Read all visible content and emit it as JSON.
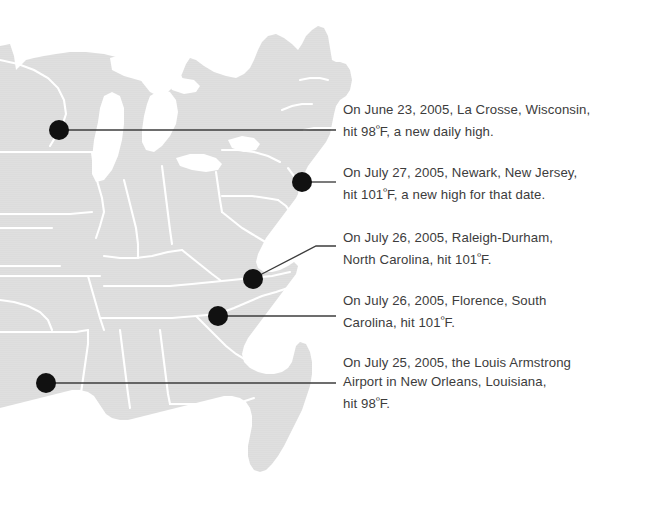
{
  "figure": {
    "type": "annotated-map",
    "region": "Eastern and Central United States",
    "background_color": "#ffffff",
    "map_fill_color": "#dcdcdc",
    "map_border_color": "#ffffff",
    "marker_color": "#111111",
    "leader_line_color": "#3c3c3c",
    "text_color": "#3c3c3c"
  },
  "annotations": [
    {
      "id": "la-crosse-wisconsin",
      "city": "La Crosse",
      "state": "Wisconsin",
      "date": "June 23, 2005",
      "temperature_f": 98,
      "lines": [
        "On June 23, 2005, La Crosse, Wisconsin,",
        "hit 98",
        "F, a new daily high."
      ],
      "text": "On June 23, 2005, La Crosse, Wisconsin, hit 98°F, a new daily high.",
      "marker": {
        "x": 59,
        "y": 130,
        "r": 10
      },
      "leader": {
        "x1": 69,
        "y1": 130,
        "x2": 336,
        "y2": 130
      }
    },
    {
      "id": "newark-new-jersey",
      "city": "Newark",
      "state": "New Jersey",
      "date": "July 27, 2005",
      "temperature_f": 101,
      "lines": [
        "On July 27, 2005, Newark, New Jersey,",
        "hit 101",
        "F, a new high for that date."
      ],
      "text": "On July 27, 2005, Newark, New Jersey, hit 101°F, a new high for that date.",
      "marker": {
        "x": 302,
        "y": 182,
        "r": 10
      },
      "leader": {
        "x1": 312,
        "y1": 182,
        "x2": 336,
        "y2": 182
      }
    },
    {
      "id": "raleigh-durham-north-carolina",
      "city": "Raleigh-Durham",
      "state": "North Carolina",
      "date": "July 26, 2005",
      "temperature_f": 101,
      "lines": [
        "On July 26, 2005, Raleigh-Durham,",
        "North Carolina, hit 101",
        "F."
      ],
      "text": "On July 26, 2005, Raleigh-Durham, North Carolina, hit 101°F.",
      "marker": {
        "x": 253,
        "y": 279,
        "r": 10
      },
      "leader": {
        "x1": 262,
        "y1": 275,
        "x2": 336,
        "y2": 246,
        "bend_x": 318,
        "bend_y": 246
      }
    },
    {
      "id": "florence-south-carolina",
      "city": "Florence",
      "state": "South Carolina",
      "date": "July 26, 2005",
      "temperature_f": 101,
      "lines": [
        "On July 26, 2005, Florence, South",
        "Carolina, hit 101",
        "F."
      ],
      "text": "On July 26, 2005, Florence, South Carolina, hit 101°F.",
      "marker": {
        "x": 218,
        "y": 316,
        "r": 10
      },
      "leader": {
        "x1": 228,
        "y1": 316,
        "x2": 336,
        "y2": 316
      }
    },
    {
      "id": "new-orleans-louisiana",
      "city": "New Orleans",
      "state": "Louisiana",
      "facility": "the Louis Armstrong Airport",
      "date": "July 25, 2005",
      "temperature_f": 98,
      "lines": [
        "On July 25, 2005, the Louis Armstrong",
        "Airport in New Orleans, Louisiana,",
        "hit 98",
        "F."
      ],
      "text": "On July 25, 2005, the Louis Armstrong Airport in New Orleans, Louisiana, hit 98°F.",
      "marker": {
        "x": 46,
        "y": 383,
        "r": 10
      },
      "leader": {
        "x1": 56,
        "y1": 383,
        "x2": 336,
        "y2": 383
      }
    }
  ],
  "degree_symbol": "º"
}
